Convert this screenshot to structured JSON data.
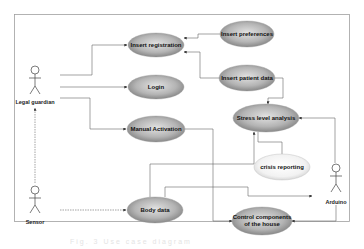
{
  "diagram": {
    "type": "use-case",
    "frame": {
      "x": 14,
      "y": 14,
      "w": 336,
      "h": 208
    },
    "actors": [
      {
        "id": "legal_guardian",
        "label": "Legal guardian",
        "x": 35,
        "y": 75
      },
      {
        "id": "sensor",
        "label": "Sensor",
        "x": 35,
        "y": 195
      },
      {
        "id": "arduino",
        "label": "Arduino",
        "x": 320,
        "y": 185
      }
    ],
    "use_cases": [
      {
        "id": "insert_registration",
        "label": "Insert registration",
        "cx": 156,
        "cy": 45,
        "rx": 28,
        "ry": 12,
        "style": "dark"
      },
      {
        "id": "insert_preferences",
        "label": "Insert preferences",
        "cx": 247,
        "cy": 34,
        "rx": 27,
        "ry": 13,
        "style": "dark"
      },
      {
        "id": "login",
        "label": "Login",
        "cx": 156,
        "cy": 87,
        "rx": 28,
        "ry": 12,
        "style": "dark"
      },
      {
        "id": "insert_patient_data",
        "label": "Insert patient data",
        "cx": 247,
        "cy": 78,
        "rx": 28,
        "ry": 13,
        "style": "dark"
      },
      {
        "id": "manual_activation",
        "label": "Manual Activation",
        "cx": 156,
        "cy": 129,
        "rx": 29,
        "ry": 13,
        "style": "dark"
      },
      {
        "id": "stress_level_analysis",
        "label": "Stress level analysis",
        "cx": 266,
        "cy": 118,
        "rx": 33,
        "ry": 14,
        "style": "dark"
      },
      {
        "id": "crisis_reporting",
        "label": "crisis reporting",
        "cx": 282,
        "cy": 167,
        "rx": 28,
        "ry": 13,
        "style": "light"
      },
      {
        "id": "body_data",
        "label": "Body data",
        "cx": 155,
        "cy": 210,
        "rx": 28,
        "ry": 13,
        "style": "dark"
      },
      {
        "id": "control_components",
        "label": "Control components",
        "label2": "of the house",
        "cx": 262,
        "cy": 221,
        "rx": 30,
        "ry": 14,
        "style": "dark"
      }
    ],
    "caption": "Fig. 3  Use case diagram"
  },
  "colors": {
    "frame": "#9a9a9a",
    "line": "#555555",
    "ellipse_dark_center": "#d8d8d8",
    "ellipse_dark_edge": "#7a7a7a",
    "ellipse_light_center": "#ffffff",
    "ellipse_light_edge": "#cfcfcf"
  }
}
